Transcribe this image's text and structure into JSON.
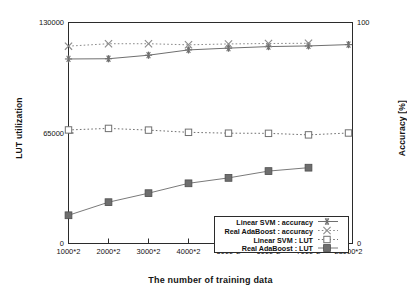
{
  "chart_data": {
    "type": "line",
    "title": "",
    "xlabel": "The number of training data",
    "ylabel": "LUT utilization",
    "ylabel_right": "Accuracy [%]",
    "categories": [
      "1000*2",
      "2000*2",
      "3000*2",
      "4000*2",
      "5000*2",
      "6000*2",
      "7000*2",
      "28000*2"
    ],
    "ylim": [
      0,
      130000
    ],
    "yticks": [
      "0",
      "65000",
      "130000"
    ],
    "ylim_right": [
      0,
      100
    ],
    "yticks_right": [
      "0",
      "100"
    ],
    "grid": false,
    "legend_position": "lower-right",
    "series": [
      {
        "name": "Linear SVM : accuracy",
        "axis": "right",
        "marker": "asterisk",
        "line": "solid",
        "values": [
          83.5,
          83.6,
          85.2,
          87.6,
          88.4,
          89.1,
          89.4,
          90.0
        ]
      },
      {
        "name": "Real AdaBoost : accuracy",
        "axis": "right",
        "marker": "cross",
        "line": "dotted",
        "values": [
          89.3,
          90.4,
          90.4,
          89.9,
          90.3,
          90.5,
          90.6,
          null
        ]
      },
      {
        "name": "Linear SVM : LUT",
        "axis": "left",
        "marker": "open-square",
        "line": "dotted",
        "values": [
          66800,
          67700,
          66700,
          65400,
          64900,
          64800,
          63900,
          65000
        ]
      },
      {
        "name": "Real AdaBoost : LUT",
        "axis": "left",
        "marker": "filled-square",
        "line": "solid",
        "values": [
          16600,
          24300,
          29600,
          35400,
          38600,
          42600,
          44600,
          null
        ]
      }
    ]
  },
  "legend": {
    "items": [
      {
        "label": "Linear SVM : accuracy",
        "marker": "asterisk-marker"
      },
      {
        "label": "Real AdaBoost : accuracy",
        "marker": "cross-marker"
      },
      {
        "label": "Linear SVM : LUT",
        "marker": "open-square-marker"
      },
      {
        "label": "Real AdaBoost : LUT",
        "marker": "filled-square-marker"
      }
    ]
  },
  "colors": {
    "axis": "#2b2b2b",
    "svm_accuracy": "#6f6f6f",
    "ada_accuracy": "#8a8a8a",
    "svm_lut": "#707070",
    "ada_lut": "#7a7a7a",
    "marker_fill": "#6e6e6e"
  }
}
